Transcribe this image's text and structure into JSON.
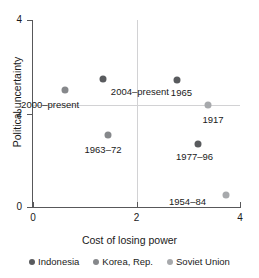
{
  "chart_data": {
    "type": "scatter",
    "title": "",
    "xlabel": "Cost of losing power",
    "ylabel": "Political uncertainty",
    "xlim": [
      0,
      4
    ],
    "ylim": [
      0,
      4
    ],
    "xticks": [
      "0",
      "2",
      "4"
    ],
    "yticks": [
      "0",
      "2",
      "4"
    ],
    "xtick_values": [
      0,
      2,
      4
    ],
    "ytick_values": [
      0,
      2,
      4
    ],
    "grid": "reference lines at x=2 and y=2",
    "legend_position": "bottom",
    "series": [
      {
        "name": "Indonesia",
        "color": "#595b5e",
        "points": [
          {
            "label": "2004–present",
            "x": 1.35,
            "y": 2.73,
            "label_dx": 8,
            "label_dy": 7
          },
          {
            "label": "1965",
            "x": 2.78,
            "y": 2.71,
            "label_dx": -6,
            "label_dy": 7
          },
          {
            "label": "1977–96",
            "x": 3.19,
            "y": 1.35,
            "label_dx": -22,
            "label_dy": 7
          }
        ]
      },
      {
        "name": "Korea, Rep.",
        "color": "#86888b",
        "points": [
          {
            "label": "2000–present",
            "x": 0.62,
            "y": 2.51,
            "label_dx": -44,
            "label_dy": 9
          },
          {
            "label": "1963–72",
            "x": 1.44,
            "y": 1.54,
            "label_dx": -23,
            "label_dy": 9
          }
        ]
      },
      {
        "name": "Soviet Union",
        "color": "#a7a9ac",
        "points": [
          {
            "label": "1917",
            "x": 3.39,
            "y": 2.19,
            "label_dx": -6,
            "label_dy": 9
          },
          {
            "label": "1954–84",
            "x": 3.73,
            "y": 0.25,
            "label_dx": -57,
            "label_dy": 1
          }
        ]
      }
    ]
  },
  "axes": {
    "x_title": "Cost of losing power",
    "y_title": "Political uncertainty",
    "x_ticks": [
      {
        "value": 0,
        "label": "0"
      },
      {
        "value": 2,
        "label": "2"
      },
      {
        "value": 4,
        "label": "4"
      }
    ],
    "y_ticks": [
      {
        "value": 0,
        "label": "0"
      },
      {
        "value": 2,
        "label": "2"
      },
      {
        "value": 4,
        "label": "4"
      }
    ]
  },
  "legend": {
    "items": [
      {
        "label": "Indonesia",
        "color": "#595b5e"
      },
      {
        "label": "Korea, Rep.",
        "color": "#86888b"
      },
      {
        "label": "Soviet Union",
        "color": "#a7a9ac"
      }
    ]
  }
}
